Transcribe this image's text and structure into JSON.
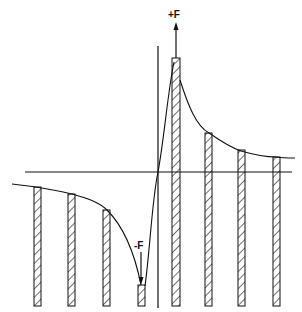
{
  "diagram": {
    "labels": {
      "plus_force": "+F",
      "minus_force": "-F"
    },
    "colors": {
      "ink": "#111111",
      "background": "#ffffff"
    },
    "bars": [
      {
        "x": 34,
        "top": 187
      },
      {
        "x": 68,
        "top": 194
      },
      {
        "x": 103,
        "top": 210
      },
      {
        "x": 138,
        "top": 285
      },
      {
        "x": 172,
        "top": 58
      },
      {
        "x": 205,
        "top": 133
      },
      {
        "x": 238,
        "top": 150
      },
      {
        "x": 273,
        "top": 157
      }
    ]
  }
}
